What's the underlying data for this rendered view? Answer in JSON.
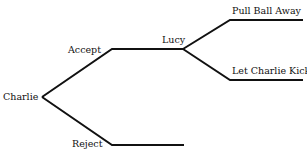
{
  "diagram": {
    "type": "game-tree",
    "nodes": {
      "root": "Charlie",
      "lucy": "Lucy"
    },
    "branches": {
      "accept": "Accept",
      "reject": "Reject",
      "pull": "Pull Ball Away",
      "let": "Let Charlie Kick"
    },
    "line_color": "#111111"
  }
}
